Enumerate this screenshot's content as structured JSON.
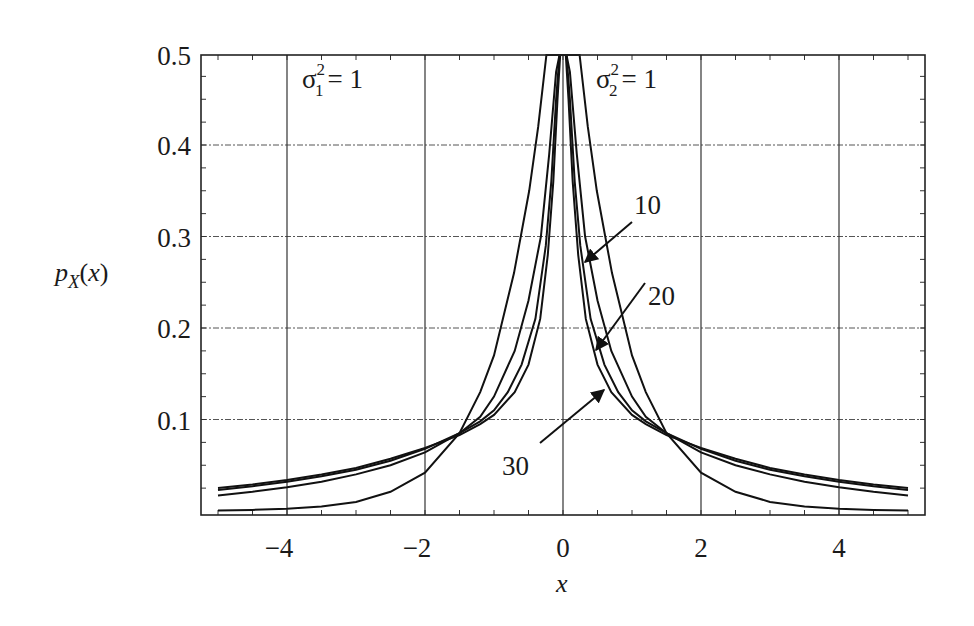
{
  "chart_data": {
    "type": "line",
    "title": "",
    "xlabel": "x",
    "ylabel": "p_X(x)",
    "xlim": [
      -5,
      5
    ],
    "ylim": [
      0,
      0.5
    ],
    "grid": true,
    "x_ticks": [
      -4,
      -2,
      0,
      2,
      4
    ],
    "x_tick_labels": [
      "−4",
      "−2",
      "0",
      "2",
      "4"
    ],
    "y_ticks": [
      0.1,
      0.2,
      0.3,
      0.4,
      0.5
    ],
    "y_tick_labels": [
      "0.1",
      "0.2",
      "0.3",
      "0.4",
      "0.5"
    ],
    "annotations": [
      {
        "text": "σ₁² = 1",
        "base": "σ",
        "sub": "1",
        "sup": "2",
        "rhs": "= 1",
        "position": "upper-left"
      },
      {
        "text": "σ₂² = 1",
        "base": "σ",
        "sub": "2",
        "sup": "2",
        "rhs": "= 1",
        "position": "upper-center-right"
      },
      {
        "text": "10",
        "arrow_to_series": "sigma2_sq=10"
      },
      {
        "text": "20",
        "arrow_to_series": "sigma2_sq=20"
      },
      {
        "text": "30",
        "arrow_to_series": "sigma2_sq=30"
      }
    ],
    "series": [
      {
        "name": "sigma2_sq=1",
        "x": [
          0,
          0.1,
          0.24,
          0.36,
          0.49,
          0.71,
          1.0,
          1.2,
          1.5,
          2.0,
          2.5,
          3.0,
          3.5,
          4.0,
          4.5,
          5.0
        ],
        "y": [
          0.707,
          0.61,
          0.5,
          0.42,
          0.35,
          0.26,
          0.17,
          0.13,
          0.085,
          0.042,
          0.021,
          0.01,
          0.005,
          0.0025,
          0.0012,
          0.0006
        ]
      },
      {
        "name": "sigma2_sq=10",
        "x": [
          0,
          0.05,
          0.1,
          0.2,
          0.32,
          0.5,
          0.7,
          1.0,
          1.2,
          1.5,
          2.0,
          2.5,
          3.0,
          3.5,
          4.0,
          4.5,
          5.0
        ],
        "y": [
          0.62,
          0.55,
          0.48,
          0.39,
          0.3,
          0.23,
          0.175,
          0.125,
          0.103,
          0.085,
          0.064,
          0.05,
          0.04,
          0.032,
          0.026,
          0.021,
          0.017
        ]
      },
      {
        "name": "sigma2_sq=20",
        "x": [
          0,
          0.05,
          0.1,
          0.17,
          0.25,
          0.4,
          0.6,
          0.8,
          1.0,
          1.2,
          1.5,
          2.0,
          2.5,
          3.0,
          3.5,
          4.0,
          4.5,
          5.0
        ],
        "y": [
          0.65,
          0.54,
          0.45,
          0.36,
          0.29,
          0.21,
          0.16,
          0.13,
          0.11,
          0.098,
          0.085,
          0.068,
          0.055,
          0.045,
          0.038,
          0.032,
          0.027,
          0.023
        ]
      },
      {
        "name": "sigma2_sq=30",
        "x": [
          0,
          0.04,
          0.08,
          0.14,
          0.22,
          0.33,
          0.5,
          0.7,
          1.0,
          1.2,
          1.5,
          2.0,
          2.5,
          3.0,
          3.5,
          4.0,
          4.5,
          5.0
        ],
        "y": [
          0.68,
          0.55,
          0.45,
          0.36,
          0.28,
          0.21,
          0.16,
          0.13,
          0.105,
          0.095,
          0.083,
          0.069,
          0.057,
          0.047,
          0.04,
          0.034,
          0.029,
          0.025
        ]
      }
    ],
    "arrows": [
      {
        "label": "10",
        "label_xy": [
          0.9,
          0.33
        ],
        "tip_xy": [
          0.32,
          0.27
        ]
      },
      {
        "label": "20",
        "label_xy": [
          1.05,
          0.255
        ],
        "tip_xy": [
          0.48,
          0.175
        ]
      },
      {
        "label": "30",
        "label_xy": [
          -0.33,
          0.075
        ],
        "tip_xy": [
          0.6,
          0.135
        ]
      }
    ],
    "legend": null
  }
}
